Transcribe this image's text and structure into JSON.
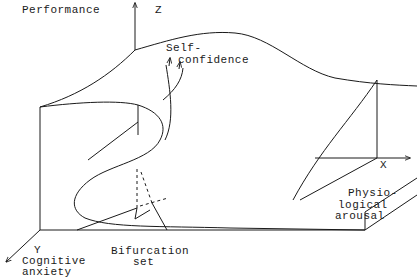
{
  "diagram": {
    "axes": {
      "z": {
        "letter": "Z",
        "label": "Performance"
      },
      "x": {
        "letter": "X",
        "label_lines": [
          "Physio-",
          "logical",
          "arousal"
        ]
      },
      "y": {
        "letter": "Y",
        "label_lines": [
          "Cognitive",
          "anxiety"
        ]
      }
    },
    "annotations": {
      "self_confidence": [
        "Self-",
        "confidence"
      ],
      "bifurcation": [
        "Bifurcation",
        "set"
      ]
    },
    "colors": {
      "line": "#1a1a1a",
      "background": "#ffffff"
    }
  }
}
